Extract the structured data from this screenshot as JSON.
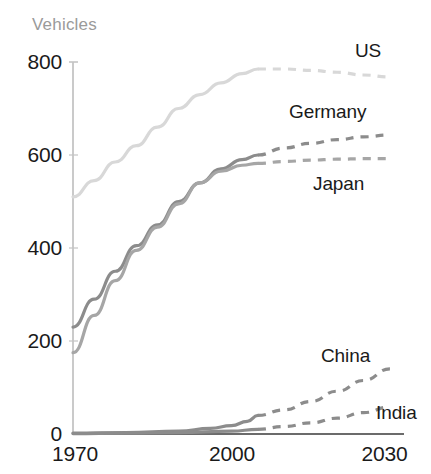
{
  "chart_data": {
    "type": "line",
    "title": "",
    "ylabel": "Vehicles",
    "xlabel": "",
    "xlim": [
      1970,
      2030
    ],
    "ylim": [
      0,
      800
    ],
    "grid": false,
    "legend_position": "inline-right-of-series",
    "ytick_labels": [
      "800",
      "600",
      "400",
      "200",
      "0"
    ],
    "ytick_values": [
      800,
      600,
      400,
      200,
      0
    ],
    "xtick_labels": [
      "1970",
      "2000",
      "2030"
    ],
    "xtick_values": [
      1970,
      2000,
      2030
    ],
    "projection_note": "dashed segments are projections after ~2005",
    "series": [
      {
        "name": "US",
        "label": "US",
        "color": "#d8d8d8",
        "historical": {
          "x": [
            1970,
            1974,
            1978,
            1982,
            1986,
            1990,
            1994,
            1998,
            2002,
            2005
          ],
          "y": [
            510,
            545,
            585,
            620,
            660,
            700,
            730,
            755,
            775,
            785
          ]
        },
        "projected": {
          "x": [
            2005,
            2010,
            2015,
            2020,
            2025,
            2030
          ],
          "y": [
            785,
            785,
            782,
            778,
            772,
            768
          ]
        }
      },
      {
        "name": "Germany",
        "label": "Germany",
        "color": "#8c8c8c",
        "historical": {
          "x": [
            1970,
            1974,
            1978,
            1982,
            1986,
            1990,
            1994,
            1998,
            2002,
            2005
          ],
          "y": [
            230,
            290,
            350,
            405,
            450,
            500,
            540,
            570,
            590,
            600
          ]
        },
        "projected": {
          "x": [
            2005,
            2010,
            2015,
            2020,
            2025,
            2030
          ],
          "y": [
            600,
            615,
            625,
            633,
            639,
            643
          ]
        }
      },
      {
        "name": "Japan",
        "label": "Japan",
        "color": "#a6a6a6",
        "historical": {
          "x": [
            1970,
            1974,
            1978,
            1982,
            1986,
            1990,
            1994,
            1998,
            2002,
            2005
          ],
          "y": [
            175,
            255,
            330,
            395,
            445,
            495,
            540,
            565,
            578,
            582
          ]
        },
        "projected": {
          "x": [
            2005,
            2010,
            2015,
            2020,
            2025,
            2030
          ],
          "y": [
            582,
            586,
            589,
            591,
            592,
            592
          ]
        }
      },
      {
        "name": "China",
        "label": "China",
        "color": "#8c8c8c",
        "historical": {
          "x": [
            1970,
            1980,
            1990,
            1996,
            2000,
            2003,
            2005
          ],
          "y": [
            2,
            3,
            6,
            12,
            18,
            27,
            40
          ]
        },
        "projected": {
          "x": [
            2005,
            2010,
            2015,
            2020,
            2025,
            2030
          ],
          "y": [
            40,
            52,
            70,
            92,
            115,
            140
          ]
        }
      },
      {
        "name": "India",
        "label": "India",
        "color": "#8c8c8c",
        "historical": {
          "x": [
            1970,
            1980,
            1990,
            2000,
            2005
          ],
          "y": [
            1,
            2,
            3,
            6,
            10
          ]
        },
        "projected": {
          "x": [
            2005,
            2010,
            2015,
            2020,
            2025,
            2030
          ],
          "y": [
            10,
            16,
            24,
            34,
            46,
            58
          ]
        }
      }
    ],
    "annotations": [
      {
        "name": "us-label",
        "text": "US",
        "x_px": 355,
        "y_px": 42
      },
      {
        "name": "germany-label",
        "text": "Germany",
        "x_px": 290,
        "y_px": 103
      },
      {
        "name": "japan-label",
        "text": "Japan",
        "x_px": 313,
        "y_px": 175
      },
      {
        "name": "china-label",
        "text": "China",
        "x_px": 321,
        "y_px": 347
      },
      {
        "name": "india-label",
        "text": "India",
        "x_px": 376,
        "y_px": 404
      }
    ]
  }
}
